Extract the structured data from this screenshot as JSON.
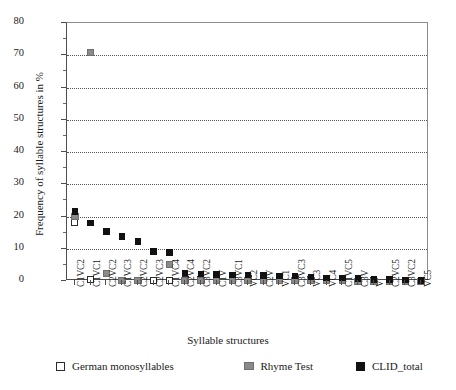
{
  "chart_data": {
    "type": "scatter",
    "title": "",
    "xlabel": "Syllable structures",
    "ylabel": "Frequency of syllable structures in %",
    "ylim": [
      0,
      80
    ],
    "yticks": [
      0,
      10,
      20,
      30,
      40,
      50,
      60,
      70,
      80
    ],
    "yminorticks": [
      5,
      15,
      25,
      35,
      45,
      55,
      65,
      75
    ],
    "grid": "horizontal-dotted",
    "legend_position": "bottom",
    "categories": [
      "C1VC2",
      "C1VC1",
      "C2VC2",
      "C1VC3",
      "C2VC2",
      "C2VC3",
      "C1VC4",
      "C2VC4",
      "C3VC2",
      "C1V",
      "C3VC1",
      "VC2",
      "C2V",
      "VC1",
      "C3VC3",
      "VC3",
      "VC4",
      "C1VC5",
      "C3V",
      "V",
      "C2VC5",
      "C3VC2",
      "VC5"
    ],
    "series": [
      {
        "name": "German monosyllables",
        "marker": "open-square",
        "color": "#ffffff",
        "edge_color": "#2b2b2b",
        "values": [
          18.0,
          0.4,
          2.3,
          0.3,
          0.2,
          0.2,
          0.2,
          0.6,
          0.5,
          1.1,
          0.9,
          0.9,
          0.8,
          0.7,
          0.6,
          0.5,
          0.4,
          0.3,
          0.3,
          0.2,
          0.2,
          0.1,
          0.1
        ]
      },
      {
        "name": "Rhyme Test",
        "marker": "filled-square",
        "color": "#8a8a8a",
        "values": [
          20.0,
          71.0,
          2.2,
          0.3,
          0.2,
          9.0,
          5.2,
          0.3,
          0.2,
          0.2,
          0.2,
          0.2,
          0.1,
          0.1,
          0.1,
          0.1,
          0.1,
          0.1,
          0.0,
          0.0,
          0.0,
          0.0,
          0.0
        ]
      },
      {
        "name": "CLID_total",
        "marker": "filled-square",
        "color": "#111111",
        "values": [
          21.5,
          18.0,
          15.3,
          13.8,
          12.3,
          9.2,
          8.8,
          2.5,
          2.2,
          2.0,
          1.9,
          1.8,
          1.7,
          1.6,
          1.5,
          1.2,
          1.0,
          0.9,
          0.7,
          0.5,
          0.4,
          0.3,
          0.2
        ]
      }
    ]
  },
  "axes": {
    "y_title": "Frequency of syllable structures in %",
    "x_title": "Syllable structures"
  },
  "legend": {
    "items": [
      {
        "label": "German monosyllables",
        "swatch": "open-square-white"
      },
      {
        "label": "Rhyme Test",
        "swatch": "filled-square-gray"
      },
      {
        "label": "CLID_total",
        "swatch": "filled-square-black"
      }
    ]
  },
  "colors": {
    "german_monosyllables": "#ffffff",
    "rhyme_test": "#8a8a8a",
    "clid_total": "#111111",
    "axis": "#4d4d4d",
    "grid": "#555555",
    "background": "#ffffff"
  }
}
